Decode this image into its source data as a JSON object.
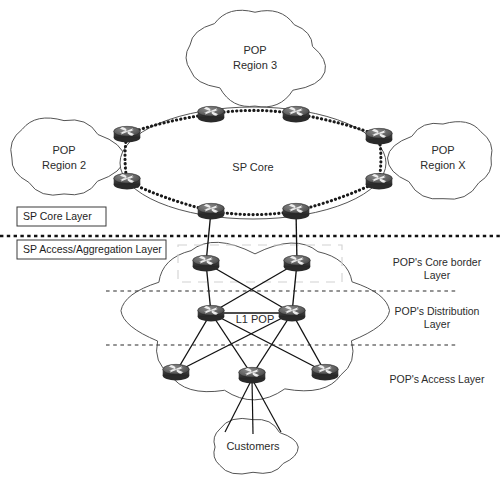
{
  "diagram": {
    "width": 503,
    "height": 479,
    "colors": {
      "background": "#ffffff",
      "stroke": "#555555",
      "link": "#111111",
      "router_body": "#4a4a4a",
      "router_top": "#6e6e6e",
      "text": "#2b2b2b",
      "ghost": "#d2d2d2"
    }
  },
  "clouds": [
    {
      "id": "pop-region-3",
      "name": "cloud-pop-region-3",
      "line1": "POP",
      "line2": "Region 3",
      "cx": 255,
      "cy": 58,
      "rx": 68,
      "ry": 42
    },
    {
      "id": "pop-region-2",
      "name": "cloud-pop-region-2",
      "line1": "POP",
      "line2": "Region 2",
      "cx": 64,
      "cy": 158,
      "rx": 52,
      "ry": 36
    },
    {
      "id": "pop-region-x",
      "name": "cloud-pop-region-x",
      "line1": "POP",
      "line2": "Region X",
      "cx": 443,
      "cy": 158,
      "rx": 52,
      "ry": 36
    },
    {
      "id": "l1-pop",
      "name": "cloud-l1-pop",
      "line1": "L1 POP",
      "line2": "",
      "cx": 255,
      "cy": 320,
      "rx": 123,
      "ry": 70
    },
    {
      "id": "customers",
      "name": "cloud-customers",
      "line1": "Customers",
      "line2": "",
      "cx": 253,
      "cy": 447,
      "rx": 44,
      "ry": 24
    }
  ],
  "core": {
    "label": "SP Core",
    "label_x": 253,
    "label_y": 168,
    "ellipse": {
      "cx": 253,
      "cy": 163,
      "rx": 133,
      "ry": 56
    },
    "routers": [
      {
        "id": "core-r1",
        "name": "router-core-top-left",
        "x": 211,
        "y": 114
      },
      {
        "id": "core-r2",
        "name": "router-core-top-right",
        "x": 296,
        "y": 114
      },
      {
        "id": "core-r3",
        "name": "router-core-right-upper",
        "x": 379,
        "y": 136
      },
      {
        "id": "core-r4",
        "name": "router-core-right-lower",
        "x": 379,
        "y": 181
      },
      {
        "id": "core-r5",
        "name": "router-core-bottom-right",
        "x": 296,
        "y": 211
      },
      {
        "id": "core-r6",
        "name": "router-core-bottom-left",
        "x": 211,
        "y": 211
      },
      {
        "id": "core-r7",
        "name": "router-core-left-lower",
        "x": 127,
        "y": 181
      },
      {
        "id": "core-r8",
        "name": "router-core-left-upper",
        "x": 127,
        "y": 134
      }
    ],
    "ring_links": [
      [
        "core-r1",
        "core-r2"
      ],
      [
        "core-r2",
        "core-r3"
      ],
      [
        "core-r3",
        "core-r4"
      ],
      [
        "core-r4",
        "core-r5"
      ],
      [
        "core-r5",
        "core-r6"
      ],
      [
        "core-r6",
        "core-r7"
      ],
      [
        "core-r7",
        "core-r8"
      ],
      [
        "core-r8",
        "core-r1"
      ]
    ]
  },
  "pop": {
    "border_routers": [
      {
        "id": "pop-b1",
        "name": "router-pop-border-left",
        "x": 206,
        "y": 263
      },
      {
        "id": "pop-b2",
        "name": "router-pop-border-right",
        "x": 297,
        "y": 263
      }
    ],
    "distribution_routers": [
      {
        "id": "pop-d1",
        "name": "router-pop-distribution-left",
        "x": 211,
        "y": 313
      },
      {
        "id": "pop-d2",
        "name": "router-pop-distribution-right",
        "x": 292,
        "y": 313
      }
    ],
    "access_routers": [
      {
        "id": "pop-a1",
        "name": "router-pop-access-left",
        "x": 176,
        "y": 372
      },
      {
        "id": "pop-a2",
        "name": "router-pop-access-center",
        "x": 252,
        "y": 375
      },
      {
        "id": "pop-a3",
        "name": "router-pop-access-right",
        "x": 325,
        "y": 372
      }
    ],
    "uplinks": [
      [
        "core-r6",
        "pop-b1"
      ],
      [
        "core-r5",
        "pop-b2"
      ]
    ],
    "border_to_distribution": [
      [
        "pop-b1",
        "pop-d1"
      ],
      [
        "pop-b1",
        "pop-d2"
      ],
      [
        "pop-b2",
        "pop-d1"
      ],
      [
        "pop-b2",
        "pop-d2"
      ]
    ],
    "distribution_mesh": [
      [
        "pop-d1",
        "pop-d2"
      ]
    ],
    "distribution_to_access": [
      [
        "pop-d1",
        "pop-a1"
      ],
      [
        "pop-d1",
        "pop-a2"
      ],
      [
        "pop-d1",
        "pop-a3"
      ],
      [
        "pop-d2",
        "pop-a1"
      ],
      [
        "pop-d2",
        "pop-a2"
      ],
      [
        "pop-d2",
        "pop-a3"
      ]
    ],
    "customer_links": [
      {
        "from": "pop-a2",
        "to_x": 225,
        "to_y": 432
      },
      {
        "from": "pop-a2",
        "to_x": 253,
        "to_y": 434
      },
      {
        "from": "pop-a2",
        "to_x": 281,
        "to_y": 432
      }
    ]
  },
  "layer_boxes": [
    {
      "id": "sp-core-layer",
      "name": "label-box-sp-core-layer",
      "text": "SP Core Layer",
      "x": 17,
      "y": 207,
      "width": 89,
      "height": 19
    },
    {
      "id": "sp-access-layer",
      "name": "label-box-sp-access-aggregation-layer",
      "text": "SP Access/Aggregation Layer",
      "x": 17,
      "y": 240,
      "width": 149,
      "height": 19
    }
  ],
  "side_labels": [
    {
      "id": "pop-core-border-layer",
      "name": "label-pop-core-border-layer",
      "line1": "POP's Core border",
      "line2": "Layer",
      "x": 437,
      "y": 266
    },
    {
      "id": "pop-distribution-layer",
      "name": "label-pop-distribution-layer",
      "line1": "POP's Distribution",
      "line2": "Layer",
      "x": 437,
      "y": 315
    },
    {
      "id": "pop-access-layer",
      "name": "label-pop-access-layer",
      "line1": "POP's Access Layer",
      "line2": "",
      "x": 437,
      "y": 379
    }
  ],
  "dividers": [
    {
      "id": "divider-major",
      "name": "divider-sp-core-access",
      "y": 236,
      "x1": 0,
      "x2": 503,
      "style": "major"
    },
    {
      "id": "divider-core-border",
      "name": "divider-pop-core-border",
      "y": 291,
      "x1": 106,
      "x2": 457,
      "style": "minor"
    },
    {
      "id": "divider-distribution",
      "name": "divider-pop-distribution",
      "y": 345,
      "x1": 106,
      "x2": 457,
      "style": "minor"
    }
  ],
  "ghost_box": {
    "name": "ghost-highlight-box",
    "x": 178,
    "y": 245,
    "width": 164,
    "height": 37
  }
}
